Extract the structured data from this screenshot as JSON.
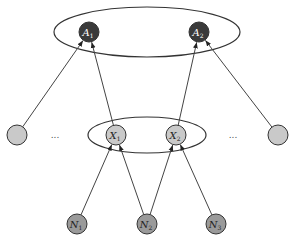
{
  "diagram": {
    "title": "",
    "colors": {
      "top_node": "#3a3a3a",
      "mid_node": "#c9c9c9",
      "bottom_node": "#9a9a9a",
      "stroke": "#333333",
      "edge": "#444444",
      "top_label": "#ffffff",
      "other_label": "#222222"
    },
    "groups": [
      {
        "id": "top-group",
        "cx": 147,
        "cy": 32,
        "rx": 93,
        "ry": 25
      },
      {
        "id": "mid-group",
        "cx": 147,
        "cy": 135,
        "rx": 59,
        "ry": 18
      }
    ],
    "nodes": [
      {
        "id": "A1",
        "label": "A",
        "sub": "1",
        "x": 89,
        "y": 32,
        "kind": "top"
      },
      {
        "id": "A2",
        "label": "A",
        "sub": "2",
        "x": 199,
        "y": 32,
        "kind": "top"
      },
      {
        "id": "L",
        "label": "",
        "sub": "",
        "x": 17,
        "y": 135,
        "kind": "mid"
      },
      {
        "id": "X1",
        "label": "X",
        "sub": "1",
        "x": 116,
        "y": 135,
        "kind": "mid"
      },
      {
        "id": "X2",
        "label": "X",
        "sub": "2",
        "x": 176,
        "y": 135,
        "kind": "mid"
      },
      {
        "id": "R",
        "label": "",
        "sub": "",
        "x": 278,
        "y": 135,
        "kind": "mid"
      },
      {
        "id": "N1",
        "label": "N",
        "sub": "1",
        "x": 77,
        "y": 224,
        "kind": "bottom"
      },
      {
        "id": "N2",
        "label": "N",
        "sub": "2",
        "x": 147,
        "y": 224,
        "kind": "bottom"
      },
      {
        "id": "N3",
        "label": "N",
        "sub": "3",
        "x": 216,
        "y": 224,
        "kind": "bottom"
      }
    ],
    "node_radius": 10,
    "ellipsis": [
      {
        "text": "...",
        "x": 55,
        "y": 138
      },
      {
        "text": "...",
        "x": 233,
        "y": 138
      }
    ],
    "edges": [
      {
        "from": "L",
        "to": "A1"
      },
      {
        "from": "X1",
        "to": "A1"
      },
      {
        "from": "X2",
        "to": "A2"
      },
      {
        "from": "R",
        "to": "A2"
      },
      {
        "from": "N1",
        "to": "X1"
      },
      {
        "from": "N2",
        "to": "X1"
      },
      {
        "from": "N2",
        "to": "X2"
      },
      {
        "from": "N3",
        "to": "X2"
      }
    ]
  }
}
